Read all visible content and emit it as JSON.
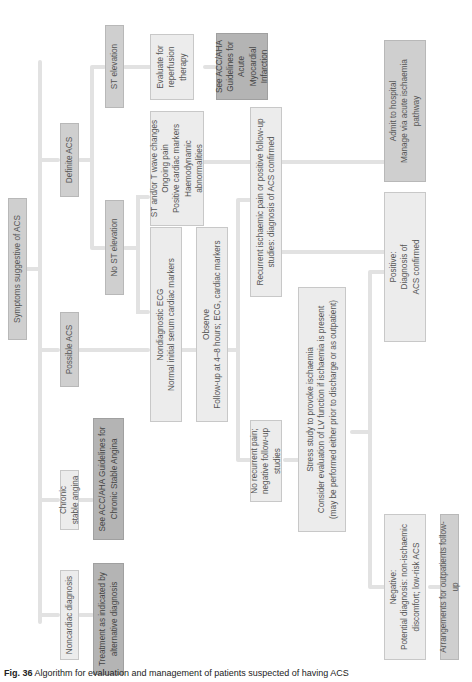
{
  "figure": {
    "orientation": "rotated 90 degrees counter-clockwise",
    "caption_label": "Fig. 36",
    "caption_text": "Algorithm for evaluation and management of patients suspected of having ACS"
  },
  "nodes": {
    "root": "Symptoms suggestive of ACS",
    "noncardiac": "Noncardiac diagnosis",
    "chronic_angina": "Chronic stable angina",
    "possible_acs": "Possible ACS",
    "definite_acs": "Definite ACS",
    "treatment_alt": "Treatment as indicated by\nalternative diagnosis",
    "see_chronic": "See ACC/AHA Guidelines for\nChronic Stable Angina",
    "no_st": "No ST elevation",
    "st_elev": "ST elevation",
    "nondiagnostic": "Nondiagnostic ECG\nNormal initial serum cardiac markers",
    "st_t_changes": "ST and/or T wave changes\nOngoing pain\nPositive cardiac markers\nHaemodynamic abnormalities",
    "evaluate_reperfusion": "Evaluate for\nreperfusion\ntherapy",
    "see_ami": "See ACC/AHA\nGuidelines for\nAcute\nMyocardial\nInfarction",
    "observe": "Observe\nFollow-up at 4–8 hours; ECG, cardiac markers",
    "no_recurrent": "No recurrent pain;\nnegative follow-up studies",
    "recurrent": "Recurrent ischaemic pain or positive follow-up\nstudies: diagnosis of ACS confirmed",
    "stress_study": "Stress study to provoke ischaemia\nConsider evaluation of LV function if ischaemia is present\n(may be performed either prior to discharge or as outpatient)",
    "negative": "Negative:\nPotential diagnosis: non-ischaemic\ndiscomfort; low-risk ACS",
    "positive": "Positive:\nDiagnosis of\nACS confirmed",
    "arrangements": "Arrangements for outpatients follow-up",
    "admit": "Admit to hospital\nManage via acute ischaemia\npathway"
  },
  "colors": {
    "light_box": "#ececec",
    "mid_box": "#cfcfcf",
    "dark_box": "#b4b4b4",
    "connector": "#e2e2e2"
  }
}
